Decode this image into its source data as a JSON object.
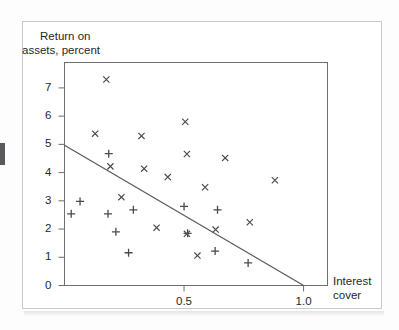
{
  "figure": {
    "background_color": "#ffffff",
    "frame_color": "#c9c9cb",
    "axis_color": "#6e6e70",
    "marker_color": "#4a4a4c",
    "line_color": "#5a5a5c"
  },
  "axes": {
    "y_title_line1": "Return on",
    "y_title_line2": "assets, percent",
    "x_title_line1": "Interest",
    "x_title_line2": "cover"
  },
  "chart_data": {
    "type": "scatter",
    "title": "",
    "xlabel": "Interest cover",
    "ylabel": "Return on assets, percent",
    "xlim": [
      0,
      1.1
    ],
    "ylim": [
      0,
      7.9
    ],
    "grid": false,
    "legend": "none",
    "xticks": [
      0.5,
      1.0
    ],
    "xticklabels": [
      "0.5",
      "1.0"
    ],
    "yticks": [
      0,
      1,
      2,
      3,
      4,
      5,
      6,
      7
    ],
    "yticklabels": [
      "0",
      "1",
      "2",
      "3",
      "4",
      "5",
      "6",
      "7"
    ],
    "series": [
      {
        "name": "x-markers",
        "marker": "x",
        "points": [
          [
            0.175,
            7.3
          ],
          [
            0.128,
            5.38
          ],
          [
            0.322,
            5.3
          ],
          [
            0.505,
            5.8
          ],
          [
            0.192,
            4.22
          ],
          [
            0.333,
            4.14
          ],
          [
            0.512,
            4.66
          ],
          [
            0.672,
            4.52
          ],
          [
            0.432,
            3.84
          ],
          [
            0.588,
            3.48
          ],
          [
            0.88,
            3.73
          ],
          [
            0.238,
            3.13
          ],
          [
            0.385,
            2.05
          ],
          [
            0.512,
            1.83
          ],
          [
            0.632,
            1.98
          ],
          [
            0.775,
            2.24
          ],
          [
            0.556,
            1.06
          ]
        ]
      },
      {
        "name": "plus-markers",
        "marker": "+",
        "points": [
          [
            0.185,
            4.67
          ],
          [
            0.065,
            2.98
          ],
          [
            0.028,
            2.54
          ],
          [
            0.182,
            2.54
          ],
          [
            0.288,
            2.68
          ],
          [
            0.5,
            2.8
          ],
          [
            0.64,
            2.68
          ],
          [
            0.215,
            1.9
          ],
          [
            0.515,
            1.85
          ],
          [
            0.268,
            1.16
          ],
          [
            0.63,
            1.22
          ],
          [
            0.768,
            0.8
          ]
        ]
      }
    ],
    "fit_line": {
      "name": "regression-line",
      "x_start": 0.0,
      "y_start": 4.97,
      "x_end": 1.0,
      "y_end": 0.0
    }
  }
}
